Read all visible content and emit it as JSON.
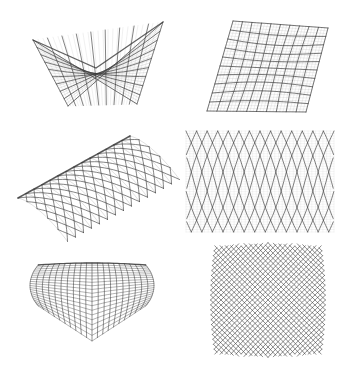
{
  "figure": {
    "ink_color": "#3a3a3a",
    "light_color": "#9a9a9a",
    "panels": [
      {
        "id": "saddle",
        "name": "Hyperbolic paraboloid (saddle) gridshell",
        "grid_u": 9,
        "grid_v": 9
      },
      {
        "id": "skewed-plane",
        "name": "Warped quadrilateral plane grid",
        "grid_u": 10,
        "grid_v": 10
      },
      {
        "id": "barrel-vault",
        "name": "Barrel vault diagonal lattice",
        "arches": 14
      },
      {
        "id": "flat-lattice",
        "name": "Flattened diamond lattice (developed pattern)",
        "diagonals": 14
      },
      {
        "id": "dome-perspective",
        "name": "Dome gridshell in perspective",
        "grid_u": 20,
        "grid_v": 20
      },
      {
        "id": "dome-plan",
        "name": "Dome gridshell in plan view",
        "diagonals": 22
      }
    ]
  }
}
